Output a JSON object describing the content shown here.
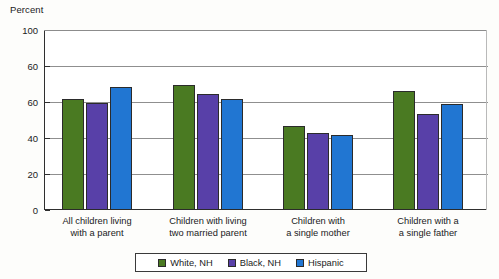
{
  "chart_data": {
    "type": "bar",
    "title": "",
    "xlabel": "",
    "ylabel": "Percent",
    "ylim": [
      0,
      100
    ],
    "grid": true,
    "legend_position": "bottom",
    "ytick_labels": [
      "100",
      "60",
      "60",
      "40",
      "20",
      "0"
    ],
    "ytick_values": [
      100,
      80,
      60,
      40,
      20,
      0
    ],
    "categories": [
      "All children living\nwith a parent",
      "Children with living\ntwo married parent",
      "Children with\na single mother",
      "Children with a\na single father"
    ],
    "category_lines": [
      [
        "All children living",
        "with a parent"
      ],
      [
        "Children with living",
        "two married parent"
      ],
      [
        "Children with",
        "a single mother"
      ],
      [
        "Children with a",
        "a single father"
      ]
    ],
    "series": [
      {
        "name": "White, NH",
        "color": "#4a7a22",
        "values": [
          61.5,
          69.5,
          46.5,
          66.0
        ]
      },
      {
        "name": "Black, NH",
        "color": "#5840a8",
        "values": [
          59.7,
          64.5,
          43.0,
          53.5
        ]
      },
      {
        "name": "Hispanic",
        "color": "#2176d2",
        "values": [
          68.5,
          61.5,
          41.5,
          59.0
        ]
      }
    ]
  },
  "legend": {
    "items": [
      {
        "label": "White, NH",
        "color": "#4a7a22"
      },
      {
        "label": "Black, NH",
        "color": "#5840a8"
      },
      {
        "label": "Hispanic",
        "color": "#2176d2"
      }
    ]
  }
}
